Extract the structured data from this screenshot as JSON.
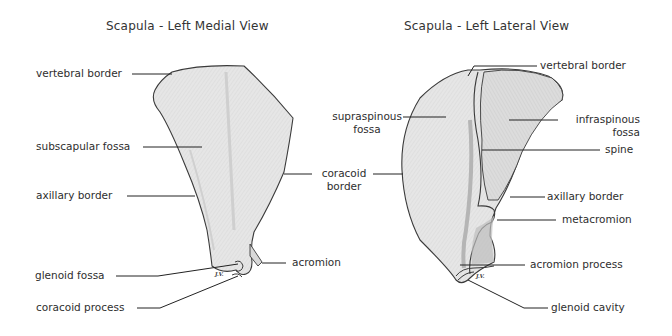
{
  "figure": {
    "medial_view": {
      "title": "Scapula - Left Medial View",
      "labels": {
        "vertebral_border": "vertebral border",
        "subscapular_fossa": "subscapular fossa",
        "axillary_border": "axillary border",
        "glenoid_fossa": "glenoid fossa",
        "coracoid_process": "coracoid process",
        "acromion": "acromion"
      },
      "artist_initials": "J.V."
    },
    "shared_label": {
      "coracoid_border_line1": "coracoid",
      "coracoid_border_line2": "border"
    },
    "lateral_view": {
      "title": "Scapula - Left Lateral View",
      "labels": {
        "vertebral_border": "vertebral border",
        "supraspinous_fossa_line1": "supraspinous",
        "supraspinous_fossa_line2": "fossa",
        "infraspinous_fossa_line1": "infraspinous",
        "infraspinous_fossa_line2": "fossa",
        "spine": "spine",
        "axillary_border": "axillary border",
        "metacromion": "metacromion",
        "acromion_process": "acromion process",
        "glenoid_cavity": "glenoid cavity"
      },
      "artist_initials": "J.V."
    }
  },
  "colors": {
    "bone_fill": "#e4e4e4",
    "bone_shade": "#c8c8c8",
    "outline": "#3a3a3a",
    "leader_line": "#222222"
  }
}
